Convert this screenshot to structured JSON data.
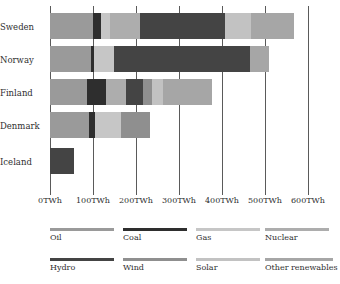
{
  "chart_data": {
    "type": "bar",
    "orientation": "horizontal",
    "stacked": true,
    "title": "",
    "xlabel": "",
    "ylabel": "",
    "unit": "TWh",
    "xlim": [
      0,
      600
    ],
    "grid": true,
    "legend_position": "bottom",
    "categories": [
      "Sweden",
      "Norway",
      "Finland",
      "Denmark",
      "Iceland"
    ],
    "x_ticks": [
      0,
      100,
      200,
      300,
      400,
      500,
      600
    ],
    "x_tick_labels": [
      "0TWh",
      "100TWh",
      "200TWh",
      "300TWh",
      "400TWh",
      "500TWh",
      "600TWh"
    ],
    "series": [
      {
        "name": "Oil",
        "color": "#9a9a9a",
        "values": [
          100,
          95,
          85,
          90,
          0
        ]
      },
      {
        "name": "Coal",
        "color": "#2e2e2e",
        "values": [
          18,
          8,
          45,
          14,
          0
        ]
      },
      {
        "name": "Gas",
        "color": "#c6c6c6",
        "values": [
          22,
          45,
          0,
          60,
          0
        ]
      },
      {
        "name": "Nuclear",
        "color": "#adadad",
        "values": [
          70,
          0,
          46,
          0,
          0
        ]
      },
      {
        "name": "Hydro",
        "color": "#444444",
        "values": [
          197,
          318,
          40,
          0,
          55
        ]
      },
      {
        "name": "Wind",
        "color": "#8f8f8f",
        "values": [
          0,
          0,
          22,
          68,
          0
        ]
      },
      {
        "name": "Solar",
        "color": "#c2c2c2",
        "values": [
          60,
          0,
          25,
          0,
          0
        ]
      },
      {
        "name": "Other renewables",
        "color": "#a6a6a6",
        "values": [
          100,
          44,
          113,
          0,
          0
        ]
      }
    ],
    "totals": [
      567,
      510,
      376,
      232,
      55
    ]
  },
  "legend": {
    "row1": [
      "Oil",
      "Coal",
      "Gas",
      "Nuclear"
    ],
    "row2": [
      "Hydro",
      "Wind",
      "Solar",
      "Other renewables"
    ]
  }
}
